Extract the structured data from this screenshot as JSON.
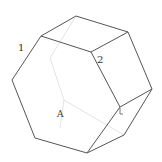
{
  "diagram": {
    "type": "hexagonal-prism",
    "labels": {
      "edge_1": "1",
      "edge_2": "2",
      "face_A": "A",
      "corner_mark": "L"
    },
    "colors": {
      "stroke": "#555555",
      "hidden_stroke": "#d8d8d8",
      "background": "#ffffff"
    }
  }
}
